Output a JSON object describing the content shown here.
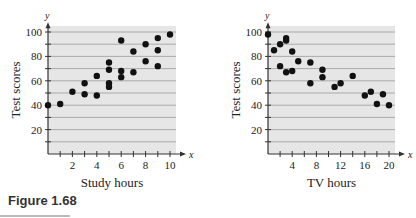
{
  "figure_caption": "Figure 1.68",
  "colors": {
    "plot_bg": "#e6e6e6",
    "grid": "#9a9a9a",
    "point": "#111111",
    "axis": "#333333"
  },
  "chart_data": [
    {
      "type": "scatter",
      "title": "",
      "xlabel": "Study hours",
      "ylabel": "Test scores",
      "x_axis_letter": "x",
      "y_axis_letter": "y",
      "xlim": [
        0,
        10.5
      ],
      "ylim": [
        0,
        105
      ],
      "xticks": [
        2,
        4,
        6,
        8,
        10
      ],
      "yticks": [
        20,
        40,
        60,
        80,
        100
      ],
      "grid": true,
      "points": [
        [
          0,
          40
        ],
        [
          1,
          41
        ],
        [
          2,
          51
        ],
        [
          3,
          58
        ],
        [
          3,
          49
        ],
        [
          4,
          64
        ],
        [
          4,
          48
        ],
        [
          5,
          75
        ],
        [
          5,
          69
        ],
        [
          5,
          58
        ],
        [
          5,
          55
        ],
        [
          6,
          93
        ],
        [
          6,
          68
        ],
        [
          6,
          63
        ],
        [
          7,
          84
        ],
        [
          7,
          67
        ],
        [
          8,
          90
        ],
        [
          8,
          76
        ],
        [
          9,
          95
        ],
        [
          9,
          85
        ],
        [
          9,
          72
        ],
        [
          10,
          98
        ]
      ]
    },
    {
      "type": "scatter",
      "title": "",
      "xlabel": "TV hours",
      "ylabel": "Test scores",
      "x_axis_letter": "x",
      "y_axis_letter": "y",
      "xlim": [
        0,
        21
      ],
      "ylim": [
        0,
        105
      ],
      "xticks": [
        4,
        8,
        12,
        16,
        20
      ],
      "yticks": [
        20,
        40,
        60,
        80,
        100
      ],
      "grid": true,
      "points": [
        [
          0,
          98
        ],
        [
          1,
          85
        ],
        [
          2,
          90
        ],
        [
          2,
          72
        ],
        [
          3,
          95
        ],
        [
          3,
          93
        ],
        [
          3,
          67
        ],
        [
          4,
          84
        ],
        [
          4,
          68
        ],
        [
          5,
          76
        ],
        [
          7,
          75
        ],
        [
          7,
          58
        ],
        [
          9,
          69
        ],
        [
          9,
          63
        ],
        [
          11,
          55
        ],
        [
          12,
          58
        ],
        [
          14,
          64
        ],
        [
          16,
          48
        ],
        [
          17,
          51
        ],
        [
          18,
          41
        ],
        [
          19,
          49
        ],
        [
          20,
          40
        ]
      ]
    }
  ]
}
